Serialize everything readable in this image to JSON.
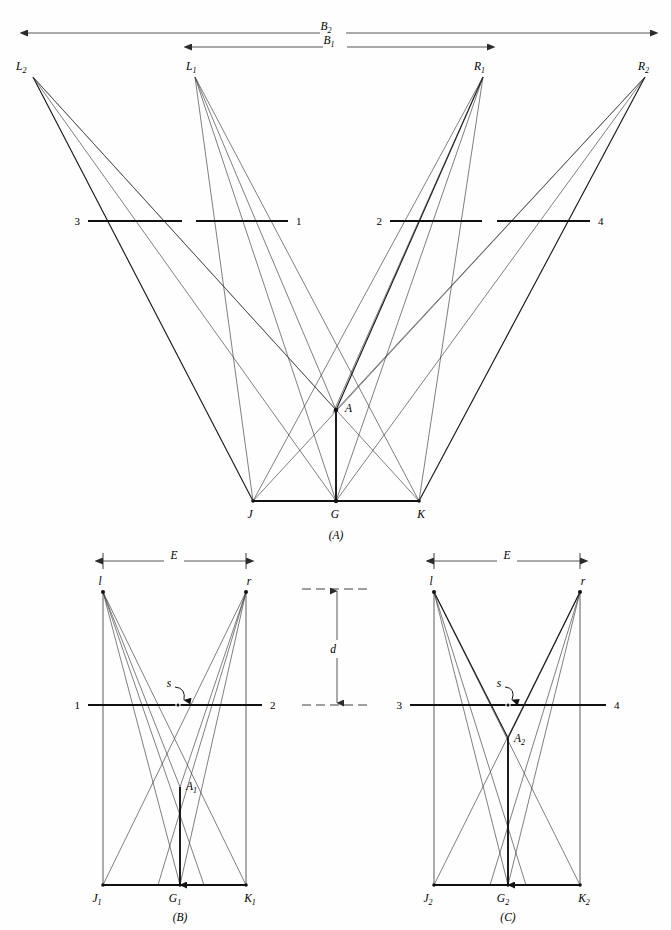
{
  "figure": {
    "background_color": "#fefefe",
    "line_color": "#3a3a3a",
    "accent_color": "#111111",
    "width": 671,
    "height": 930
  },
  "panel_a": {
    "caption": "(A)",
    "stations": [
      {
        "name": "L2",
        "label": "L",
        "sub": "2",
        "x": 33,
        "y": 77
      },
      {
        "name": "L1",
        "label": "L",
        "sub": "1",
        "x": 195,
        "y": 77
      },
      {
        "name": "R1",
        "label": "R",
        "sub": "1",
        "x": 483,
        "y": 77
      },
      {
        "name": "R2",
        "label": "R",
        "sub": "2",
        "x": 645,
        "y": 77
      }
    ],
    "ground_points": [
      {
        "name": "J",
        "label": "J",
        "sub": "",
        "x": 253,
        "y": 501
      },
      {
        "name": "G",
        "label": "G",
        "sub": "",
        "x": 336,
        "y": 501
      },
      {
        "name": "K",
        "label": "K",
        "sub": "",
        "x": 419,
        "y": 501
      }
    ],
    "apex": {
      "name": "A",
      "label": "A",
      "sub": "",
      "x": 336,
      "y": 410
    },
    "baseline_y": 501,
    "dimensions": [
      {
        "name": "B2",
        "label": "B",
        "sub": "2",
        "x1": 28,
        "x2": 650,
        "y": 33
      },
      {
        "name": "B1",
        "label": "B",
        "sub": "1",
        "x1": 192,
        "x2": 487,
        "y": 47
      }
    ],
    "reference_lines": [
      {
        "name": "line-3",
        "label": "3",
        "x1": 88,
        "x2": 182,
        "y": 221,
        "label_side": "left"
      },
      {
        "name": "line-1",
        "label": "1",
        "x1": 196,
        "x2": 288,
        "y": 221,
        "label_side": "right"
      },
      {
        "name": "line-2",
        "label": "2",
        "x1": 390,
        "x2": 482,
        "y": 221,
        "label_side": "left"
      },
      {
        "name": "line-4",
        "label": "4",
        "x1": 497,
        "x2": 590,
        "y": 221,
        "label_side": "right"
      }
    ]
  },
  "panel_b": {
    "caption": "(B)",
    "frame": {
      "left": 103,
      "right": 246,
      "top": 592,
      "bottom": 885
    },
    "lens_left": {
      "name": "l",
      "label": "l",
      "x": 103,
      "y": 592
    },
    "lens_right": {
      "name": "r",
      "label": "r",
      "x": 246,
      "y": 592
    },
    "apex": {
      "name": "A1",
      "label": "A",
      "sub": "1",
      "x": 180,
      "y": 787
    },
    "ground_points": [
      {
        "name": "J1",
        "label": "J",
        "sub": "1",
        "x": 103,
        "y": 885
      },
      {
        "name": "G1",
        "label": "G",
        "sub": "1",
        "x": 180,
        "y": 885
      },
      {
        "name": "K1",
        "label": "K",
        "sub": "1",
        "x": 246,
        "y": 885
      }
    ],
    "dimension": {
      "name": "E",
      "label": "E",
      "x1": 103,
      "x2": 246,
      "y": 561
    },
    "reference_line": {
      "left_label": "1",
      "right_label": "2",
      "x1": 88,
      "x2": 262,
      "y": 705
    },
    "parallax_mark": {
      "label": "s",
      "x": 178,
      "y": 705,
      "text_x": 170,
      "text_y": 692
    }
  },
  "panel_c": {
    "caption": "(C)",
    "frame": {
      "left": 434,
      "right": 580,
      "top": 592,
      "bottom": 885
    },
    "lens_left": {
      "name": "l",
      "label": "l",
      "x": 434,
      "y": 592
    },
    "lens_right": {
      "name": "r",
      "label": "r",
      "x": 580,
      "y": 592
    },
    "apex": {
      "name": "A2",
      "label": "A",
      "sub": "2",
      "x": 508,
      "y": 738
    },
    "ground_points": [
      {
        "name": "J2",
        "label": "J",
        "sub": "2",
        "x": 434,
        "y": 885
      },
      {
        "name": "G2",
        "label": "G",
        "sub": "2",
        "x": 508,
        "y": 885
      },
      {
        "name": "K2",
        "label": "K",
        "sub": "2",
        "x": 580,
        "y": 885
      }
    ],
    "dimension": {
      "name": "E",
      "label": "E",
      "x1": 434,
      "x2": 580,
      "y": 561
    },
    "reference_line": {
      "left_label": "3",
      "right_label": "4",
      "x1": 410,
      "x2": 606,
      "y": 705
    },
    "parallax_mark": {
      "label": "s",
      "x": 508,
      "y": 705,
      "text_x": 498,
      "text_y": 692
    }
  },
  "center_dimension": {
    "name": "d",
    "label": "d",
    "x": 337,
    "y_top": 589,
    "y_bottom": 705,
    "dash_top": {
      "x1": 302,
      "x2": 372,
      "y": 589
    },
    "dash_bottom": {
      "x1": 302,
      "x2": 372,
      "y": 705
    },
    "label_x": 331,
    "label_y": 653
  }
}
